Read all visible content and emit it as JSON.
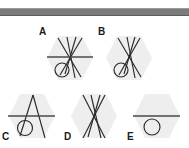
{
  "canvas": {
    "width": 189,
    "height": 148,
    "background": "#ffffff"
  },
  "top_bar": {
    "name": "gray-divider-bar",
    "color": "#7b7b7b",
    "y": 8,
    "height": 6
  },
  "palette": {
    "hexagon_fill": "#eeeeee",
    "line_color": "#2a2a2a",
    "horizontal_line_color": "#4a4a4a",
    "label_color": "#1a1a1a"
  },
  "figures": [
    {
      "id": "A",
      "label": "A",
      "label_x": 39,
      "label_y": 27,
      "x": 46,
      "y": 34,
      "hexagon": true,
      "has_horizontal_line": true,
      "has_circle": true,
      "crossing_lines": 4,
      "description": "hexagon with four crossing diagonal lines, one horizontal line and a small circle at lower left"
    },
    {
      "id": "B",
      "label": "B",
      "label_x": 98,
      "label_y": 27,
      "x": 105,
      "y": 34,
      "hexagon": true,
      "has_horizontal_line": false,
      "has_circle": true,
      "crossing_lines": 4,
      "description": "hexagon with four crossing diagonal lines and a small circle at lower left"
    },
    {
      "id": "C",
      "label": "C",
      "label_x": 2,
      "label_y": 132,
      "x": 8,
      "y": 92,
      "hexagon": true,
      "has_horizontal_line": true,
      "has_circle": true,
      "crossing_lines": 2,
      "description": "hexagon with two lines forming an A peak, a horizontal line and a small circle at lower left"
    },
    {
      "id": "D",
      "label": "D",
      "label_x": 64,
      "label_y": 132,
      "x": 70,
      "y": 92,
      "hexagon": true,
      "has_horizontal_line": false,
      "has_circle": false,
      "crossing_lines": 4,
      "description": "hexagon with four crossing diagonal lines only"
    },
    {
      "id": "E",
      "label": "E",
      "label_x": 127,
      "label_y": 132,
      "x": 133,
      "y": 92,
      "hexagon": true,
      "has_horizontal_line": true,
      "has_circle": true,
      "crossing_lines": 0,
      "description": "hexagon with a horizontal line and a small circle below it"
    }
  ]
}
